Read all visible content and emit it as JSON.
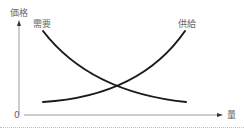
{
  "diagram": {
    "type": "supply-demand",
    "axes": {
      "y_label": "価格",
      "x_label": "量",
      "origin_label": "0"
    },
    "curves": [
      {
        "name": "demand",
        "label": "需要",
        "direction": "downward-sloping"
      },
      {
        "name": "supply",
        "label": "供給",
        "direction": "upward-sloping"
      }
    ],
    "colors": {
      "axis": "#9a9a9a",
      "curve": "#1a1a1a",
      "label": "#666666"
    }
  }
}
